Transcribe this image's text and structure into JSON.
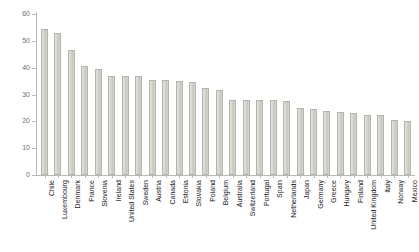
{
  "chart": {
    "title": "",
    "type": "bar"
  },
  "chart_data": {
    "type": "bar",
    "title": "",
    "subtitle": "",
    "xlabel": "",
    "ylabel": "",
    "ylim": [
      0,
      60
    ],
    "yticks": [
      0,
      10,
      20,
      30,
      40,
      50,
      60
    ],
    "ytick_labels": [
      "0",
      "10",
      "20",
      "30",
      "40",
      "50",
      "60"
    ],
    "grid": false,
    "legend": null,
    "bar_color": "#d6d7d0",
    "bar_edge_color": "#b3b4ac",
    "categories": [
      "Chile",
      "Luxembourg",
      "Denmark",
      "France",
      "Slovenia",
      "Ireland",
      "United States",
      "Sweden",
      "Austria",
      "Canada",
      "Estonia",
      "Slovakia",
      "Poland",
      "Belgium",
      "Australia",
      "Switzerland",
      "Portugal",
      "Spain",
      "Netherlands",
      "Japan",
      "Germany",
      "Greece",
      "Hungary",
      "Finland",
      "United Kingdom",
      "Italy",
      "Norway",
      "Mexico"
    ],
    "values": [
      54.5,
      53.0,
      46.5,
      40.5,
      39.5,
      37.0,
      37.0,
      37.0,
      35.5,
      35.5,
      35.0,
      34.5,
      32.5,
      31.5,
      28.0,
      28.0,
      28.0,
      28.0,
      27.5,
      25.0,
      24.5,
      24.0,
      23.5,
      23.0,
      22.5,
      22.5,
      20.5,
      20.0
    ]
  }
}
